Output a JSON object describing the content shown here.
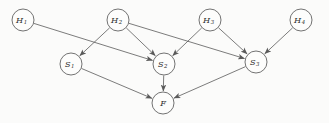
{
  "diagram": {
    "type": "directed-acyclic-graph",
    "background_color": "#fbfbfa",
    "node_fill": "#fdfdfc",
    "node_stroke": "#5a5a5a",
    "edge_color": "#5a5a5a",
    "nodes": [
      {
        "id": "H1",
        "base": "H",
        "sub": "1",
        "cx": 23,
        "cy": 20,
        "r": 11
      },
      {
        "id": "H2",
        "base": "H",
        "sub": "2",
        "cx": 118,
        "cy": 20,
        "r": 11
      },
      {
        "id": "H3",
        "base": "H",
        "sub": "3",
        "cx": 210,
        "cy": 20,
        "r": 11
      },
      {
        "id": "H4",
        "base": "H",
        "sub": "4",
        "cx": 301,
        "cy": 20,
        "r": 11
      },
      {
        "id": "S1",
        "base": "S",
        "sub": "1",
        "cx": 71,
        "cy": 64,
        "r": 11
      },
      {
        "id": "S2",
        "base": "S",
        "sub": "2",
        "cx": 164,
        "cy": 64,
        "r": 11
      },
      {
        "id": "S3",
        "base": "S",
        "sub": "3",
        "cx": 256,
        "cy": 62,
        "r": 11
      },
      {
        "id": "F",
        "base": "F",
        "sub": "",
        "cx": 163,
        "cy": 103,
        "r": 11
      }
    ],
    "edges": [
      {
        "from": "H1",
        "to": "S2"
      },
      {
        "from": "H2",
        "to": "S1"
      },
      {
        "from": "H2",
        "to": "S2"
      },
      {
        "from": "H2",
        "to": "S3"
      },
      {
        "from": "H3",
        "to": "S2"
      },
      {
        "from": "H3",
        "to": "S3"
      },
      {
        "from": "H4",
        "to": "S3"
      },
      {
        "from": "S1",
        "to": "F"
      },
      {
        "from": "S2",
        "to": "F"
      },
      {
        "from": "S3",
        "to": "F"
      }
    ]
  }
}
